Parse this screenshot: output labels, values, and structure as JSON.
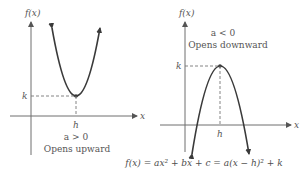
{
  "figure": {
    "left_graph": {
      "y_axis_label": "f(x)",
      "x_axis_label": "x",
      "vertex_x_label": "h",
      "vertex_y_label": "k",
      "condition": "a > 0",
      "description": "Opens upward"
    },
    "right_graph": {
      "y_axis_label": "f(x)",
      "x_axis_label": "x",
      "vertex_x_label": "h",
      "vertex_y_label": "k",
      "condition": "a < 0",
      "description": "Opens downward"
    },
    "formula": "f(x) = ax² + bx + c = a(x − h)² + k"
  },
  "colors": {
    "axis": "#6f6f6f",
    "curve": "#3a3a3a",
    "text": "#555555"
  }
}
